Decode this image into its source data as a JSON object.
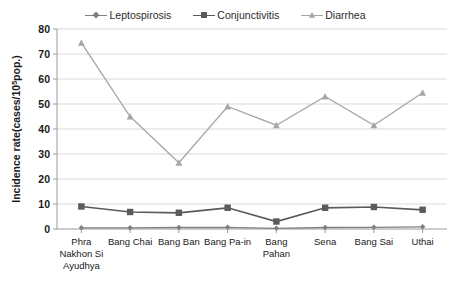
{
  "chart_data": {
    "type": "line",
    "title": "",
    "xlabel": "",
    "ylabel": "Incidence rate(cases/10",
    "ylabel_sup": "5",
    "ylabel_tail": "pop.)",
    "categories": [
      "Phra\nNakhon Si\nAyudhya",
      "Bang Chai",
      "Bang Ban",
      "Bang Pa-in",
      "Bang\nPahan",
      "Sena",
      "Bang Sai",
      "Uthai"
    ],
    "ylim": [
      0,
      80
    ],
    "yticks": [
      0,
      10,
      20,
      30,
      40,
      50,
      60,
      70,
      80
    ],
    "grid": true,
    "legend_position": "top-center",
    "series": [
      {
        "name": "Leptospirosis",
        "marker": "diamond",
        "color": "#808080",
        "values": [
          0.5,
          0.5,
          0.6,
          0.7,
          0.3,
          0.6,
          0.7,
          0.9
        ]
      },
      {
        "name": "Conjunctivitis",
        "marker": "square",
        "color": "#5a5a5a",
        "values": [
          9.0,
          6.8,
          6.5,
          8.5,
          3.0,
          8.5,
          8.8,
          7.7
        ]
      },
      {
        "name": "Diarrhea",
        "marker": "triangle",
        "color": "#a6a6a6",
        "values": [
          74.5,
          45.0,
          26.5,
          49.0,
          41.5,
          53.0,
          41.5,
          54.5
        ]
      }
    ]
  },
  "legend": {
    "items": [
      {
        "label": "Leptospirosis"
      },
      {
        "label": "Conjunctivitis"
      },
      {
        "label": "Diarrhea"
      }
    ]
  },
  "axes": {
    "y_title_main": "Incidence rate(cases/10",
    "y_title_sup": "5",
    "y_title_tail": "pop.)"
  }
}
